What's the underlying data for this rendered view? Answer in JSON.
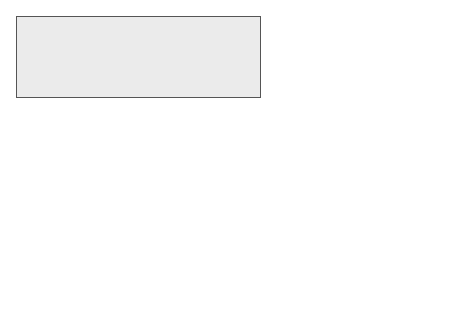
{
  "interface_panel": {
    "title": "Interface",
    "database_label": "Database",
    "package": {
      "title_line1": "Authentication",
      "title_line2": "Registration Interface",
      "classes": [
        {
          "name": "Authentication",
          "attributes": "…",
          "methods": [
            "register(…)",
            "authenticate(…)"
          ]
        },
        {
          "name": "Key_database",
          "attributes": "…",
          "methods": [
            "store_key(…)",
            "retrieve_key(…)"
          ]
        }
      ]
    }
  },
  "variability_panel": {
    "title": "Variability Diagram",
    "variation_points": [
      {
        "tag": "VP",
        "line1": "Auth.",
        "line2": "Key Store."
      },
      {
        "tag": "VP",
        "line1": "Auth.",
        "line2": "Algorithm"
      }
    ],
    "variants": [
      {
        "tag": "V",
        "label": "List"
      },
      {
        "tag": "V",
        "label": "Relational"
      },
      {
        "tag": "V",
        "label": "Card"
      },
      {
        "tag": "V",
        "label": "Keypad"
      }
    ],
    "dependency_label": "requires_vp_vp"
  },
  "colors": {
    "panel_bg": "#ebebeb",
    "package_bg": "#d9d9d9",
    "border": "#222222"
  }
}
